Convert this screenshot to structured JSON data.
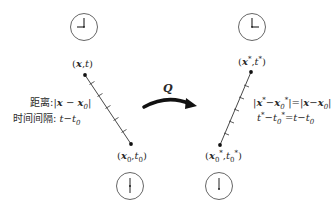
{
  "diagram": {
    "transform_label": "Q",
    "left": {
      "event_top": {
        "x": "x",
        "t": "t"
      },
      "event_bottom": {
        "x": "x",
        "sub": "0",
        "t": "t",
        "tsub": "0"
      },
      "distance_label": "距离:",
      "distance_expr": "|x − x0|",
      "interval_label": "时间间隔:",
      "interval_expr": "t−t0",
      "clock_top": "clock-9-00",
      "clock_bottom": "clock-6-00"
    },
    "right": {
      "event_top": {
        "x": "x*",
        "t": "t*"
      },
      "event_bottom": {
        "x": "x0*",
        "t": "t0*"
      },
      "distance_eq": "|x*−x0*|=|x−x0|",
      "interval_eq": "t*−t0*=t−t0",
      "clock_top": "clock-3-00",
      "clock_bottom": "clock-6-00"
    },
    "colors": {
      "ink": "#222222",
      "arrow": "#111111",
      "background": "#ffffff"
    }
  }
}
